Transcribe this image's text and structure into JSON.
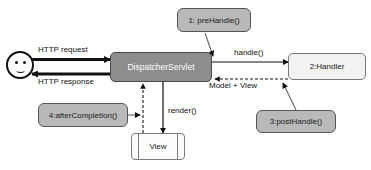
{
  "diagram": {
    "colors": {
      "dark_gray": "#8d8d8d",
      "mid_gray": "#b9b9b9",
      "light": "#f2f2f0",
      "stroke": "#111111"
    },
    "nodes": [
      {
        "id": "actor",
        "label": "",
        "kind": "actor"
      },
      {
        "id": "dispatcher-servlet",
        "label": "DispatcherServlet",
        "kind": "gray-dark"
      },
      {
        "id": "pre-handle",
        "label": "1: preHandle()",
        "kind": "gray-mid"
      },
      {
        "id": "handler",
        "label": "2:Handler",
        "kind": "light"
      },
      {
        "id": "post-handle",
        "label": "3:postHandle()",
        "kind": "gray-mid"
      },
      {
        "id": "after-completion",
        "label": "4:afterCompletion()",
        "kind": "gray-mid"
      },
      {
        "id": "view",
        "label": "View",
        "kind": "view"
      }
    ],
    "edges": [
      {
        "id": "http-request",
        "label": "HTTP request",
        "style": "solid-thick",
        "from": "actor",
        "to": "dispatcher-servlet"
      },
      {
        "id": "http-response",
        "label": "HTTP response",
        "style": "solid-thick",
        "from": "dispatcher-servlet",
        "to": "actor"
      },
      {
        "id": "handle",
        "label": "handle()",
        "style": "solid",
        "from": "dispatcher-servlet",
        "to": "handler"
      },
      {
        "id": "model-view",
        "label": "Model + View",
        "style": "dashed",
        "from": "handler",
        "to": "dispatcher-servlet"
      },
      {
        "id": "render",
        "label": "render()",
        "style": "solid",
        "from": "dispatcher-servlet",
        "to": "view"
      },
      {
        "id": "view-return",
        "label": "",
        "style": "dashed",
        "from": "view",
        "to": "dispatcher-servlet"
      },
      {
        "id": "pre-handle-link",
        "label": "",
        "style": "solid",
        "from": "pre-handle",
        "to": "handle"
      },
      {
        "id": "post-handle-link",
        "label": "",
        "style": "solid",
        "from": "post-handle",
        "to": "model-view"
      },
      {
        "id": "after-completion-link",
        "label": "",
        "style": "solid",
        "from": "after-completion",
        "to": "view-return"
      }
    ]
  }
}
